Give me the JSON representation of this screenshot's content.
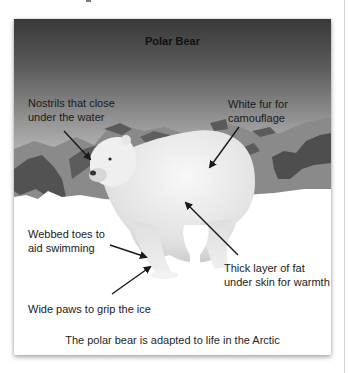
{
  "figure": {
    "title": "Polar Bear",
    "caption": "The polar bear is adapted to life in the Arctic",
    "image_subject": "polar-bear-in-arctic-landscape",
    "labels": [
      {
        "id": "nostrils",
        "lines": [
          "Nostrils that close",
          "under the water"
        ]
      },
      {
        "id": "fur",
        "lines": [
          "White fur for",
          "camouflage"
        ]
      },
      {
        "id": "toes",
        "lines": [
          "Webbed toes to",
          "aid swimming"
        ]
      },
      {
        "id": "fat",
        "lines": [
          "Thick layer of fat",
          "under skin for warmth"
        ]
      },
      {
        "id": "paws",
        "lines": [
          "Wide paws to grip the ice"
        ]
      }
    ]
  },
  "colors": {
    "sky_top": "#393939",
    "sky_bottom": "#d2d2d2",
    "mountain_light": "#8a8a8a",
    "mountain_dark": "#4e4e4e",
    "snow": "#ffffff",
    "arrow": "#1a1a1a"
  }
}
